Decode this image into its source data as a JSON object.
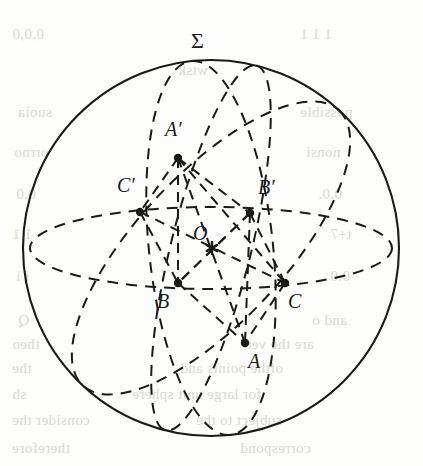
{
  "figure": {
    "kind": "spherical-geometry-diagram",
    "stroke_color": "#1a1a1a",
    "dash_color": "#1a1a1a",
    "background_color": "#fdfdfb",
    "sphere": {
      "label": "Σ",
      "center_x": 211,
      "center_y": 248,
      "radius": 188,
      "label_x": 191,
      "label_y": 28
    },
    "equator": {
      "name": "equator-ellipse",
      "cx": 211,
      "cy": 248,
      "rx": 181,
      "ry": 41
    },
    "center_point": {
      "name": "O",
      "label": "O",
      "x": 212,
      "y": 248,
      "marker": "asterisk",
      "label_x": 193,
      "label_y": 222
    },
    "points": [
      {
        "name": "A-prime",
        "label": "A′",
        "x": 178,
        "y": 158,
        "label_x": 165,
        "label_y": 118
      },
      {
        "name": "C-prime",
        "label": "C′",
        "x": 140,
        "y": 212,
        "label_x": 117,
        "label_y": 174
      },
      {
        "name": "B-prime",
        "label": "B′",
        "x": 250,
        "y": 213,
        "label_x": 258,
        "label_y": 176
      },
      {
        "name": "B",
        "label": "B",
        "x": 178,
        "y": 283,
        "label_x": 157,
        "label_y": 290
      },
      {
        "name": "C",
        "label": "C",
        "x": 285,
        "y": 283,
        "label_x": 288,
        "label_y": 290
      },
      {
        "name": "A",
        "label": "A",
        "x": 245,
        "y": 343,
        "label_x": 248,
        "label_y": 350
      }
    ],
    "great_circles": [
      {
        "name": "great-circle-through-A-Aprime",
        "note": "near-vertical ellipse tilted left, passes A′ top and A bottom"
      },
      {
        "name": "great-circle-through-B-Bprime",
        "note": "near-vertical ellipse through the poles, passes B′ and B"
      },
      {
        "name": "great-circle-through-C-Cprime",
        "note": "tilted ellipse from upper-left to lower-right, passes C′ and C"
      }
    ],
    "chords": [
      {
        "name": "chord-Aprime-A",
        "from": "A-prime",
        "to": "A"
      },
      {
        "name": "chord-Bprime-B",
        "from": "B-prime",
        "to": "B"
      },
      {
        "name": "chord-Cprime-C",
        "from": "C-prime",
        "to": "C"
      },
      {
        "name": "chord-Aprime-Bprime",
        "from": "A-prime",
        "to": "B-prime"
      },
      {
        "name": "chord-Aprime-Cprime",
        "from": "A-prime",
        "to": "C-prime"
      },
      {
        "name": "chord-Aprime-C",
        "from": "A-prime",
        "to": "C"
      },
      {
        "name": "chord-Aprime-B",
        "from": "A-prime",
        "to": "B"
      },
      {
        "name": "chord-Bprime-C",
        "from": "B-prime",
        "to": "C"
      },
      {
        "name": "chord-Bprime-B2",
        "from": "B-prime",
        "to": "B"
      },
      {
        "name": "chord-Cprime-B",
        "from": "C-prime",
        "to": "B"
      },
      {
        "name": "chord-B-A",
        "from": "B",
        "to": "A"
      },
      {
        "name": "chord-C-A",
        "from": "C",
        "to": "A"
      },
      {
        "name": "chord-Bprime-A",
        "from": "B-prime",
        "to": "A"
      }
    ]
  },
  "bleed_text": [
    {
      "text": "0,0,0",
      "x": 12,
      "y": 26
    },
    {
      "text": "1 1 1",
      "x": 300,
      "y": 26
    },
    {
      "text": "wtsk",
      "x": 178,
      "y": 62
    },
    {
      "text": "suoia",
      "x": 18,
      "y": 104
    },
    {
      "text": "possible",
      "x": 300,
      "y": 104
    },
    {
      "text": "orrno",
      "x": 14,
      "y": 144
    },
    {
      "text": "nonsi",
      "x": 306,
      "y": 144
    },
    {
      "text": "0,0",
      "x": 16,
      "y": 186
    },
    {
      "text": "0.0.",
      "x": 318,
      "y": 186
    },
    {
      "text": "1 1",
      "x": 12,
      "y": 226
    },
    {
      "text": "t+7",
      "x": 330,
      "y": 226
    },
    {
      "text": "i i",
      "x": 16,
      "y": 268
    },
    {
      "text": "0.0",
      "x": 330,
      "y": 268
    },
    {
      "text": "Q ",
      "x": 18,
      "y": 312
    },
    {
      "text": "and o",
      "x": 312,
      "y": 312
    },
    {
      "text": "theo",
      "x": 12,
      "y": 336
    },
    {
      "text": "are the ver",
      "x": 246,
      "y": 336
    },
    {
      "text": "the",
      "x": 12,
      "y": 360
    },
    {
      "text": "ofthe points and ",
      "x": 180,
      "y": 360
    },
    {
      "text": "sh",
      "x": 12,
      "y": 386
    },
    {
      "text": "for large unit sphere",
      "x": 132,
      "y": 386
    },
    {
      "text": "consider the",
      "x": 12,
      "y": 412
    },
    {
      "text": "subject to the",
      "x": 196,
      "y": 412
    },
    {
      "text": "therefore",
      "x": 12,
      "y": 440
    },
    {
      "text": "correspond",
      "x": 240,
      "y": 440
    }
  ]
}
